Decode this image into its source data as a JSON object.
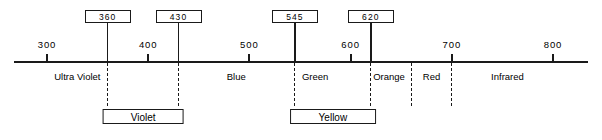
{
  "chart_data": {
    "type": "line",
    "title": "",
    "xlabel": "",
    "ylabel": "",
    "xlim": [
      285,
      812
    ],
    "grid": false,
    "legend": false,
    "axis": {
      "ticks": [
        {
          "value": 300,
          "label": "300"
        },
        {
          "value": 400,
          "label": "400"
        },
        {
          "value": 500,
          "label": "500"
        },
        {
          "value": 600,
          "label": "600"
        },
        {
          "value": 700,
          "label": "700"
        },
        {
          "value": 800,
          "label": "800"
        }
      ]
    },
    "callouts": [
      {
        "label": "360",
        "value": 360
      },
      {
        "label": "430",
        "value": 430
      },
      {
        "label": "545",
        "value": 545
      },
      {
        "label": "620",
        "value": 620
      }
    ],
    "dividers": [
      360,
      430,
      545,
      620,
      660,
      700
    ],
    "bands": [
      {
        "label": "Ultra Violet",
        "center": 330
      },
      {
        "label": "Blue",
        "center": 487
      },
      {
        "label": "Green",
        "center": 565
      },
      {
        "label": "Orange",
        "center": 638
      },
      {
        "label": "Red",
        "center": 680
      },
      {
        "label": "Infrared",
        "center": 755
      }
    ],
    "brackets": [
      {
        "label": "Violet",
        "from": 360,
        "to": 430
      },
      {
        "label": "Yellow",
        "from": 545,
        "to": 620
      }
    ]
  },
  "colors": {
    "ink": "#1a1a1a",
    "background": "#ffffff"
  }
}
